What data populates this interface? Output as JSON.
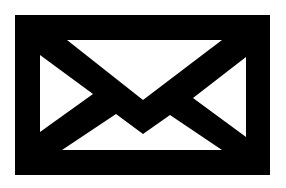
{
  "icon": {
    "name": "envelope-icon",
    "label": "Mail",
    "colors": {
      "background": "#ffffff",
      "foreground": "#000000",
      "inner": "#ffffff"
    },
    "geometry": {
      "outer_rect": [
        15,
        15,
        270,
        175
      ],
      "inner_rect": [
        40,
        40,
        246,
        150
      ]
    }
  }
}
